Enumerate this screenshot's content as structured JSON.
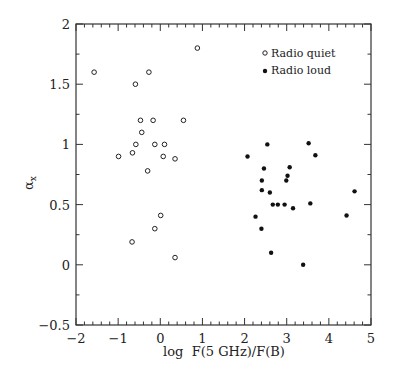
{
  "chart_data": {
    "type": "scatter",
    "title": "",
    "xlabel": "log F(5 GHz)/F(B)",
    "ylabel": "αx",
    "xlim": [
      -2,
      5
    ],
    "ylim": [
      -0.5,
      2
    ],
    "x_ticks": [
      -2,
      -1,
      0,
      1,
      2,
      3,
      4,
      5
    ],
    "x_tick_labels": [
      "−2",
      "−1",
      "0",
      "1",
      "2",
      "3",
      "4",
      "5"
    ],
    "y_ticks": [
      -0.5,
      0,
      0.5,
      1,
      1.5,
      2
    ],
    "y_tick_labels": [
      "−0.5",
      "0",
      "0.5",
      "1",
      "1.5",
      "2"
    ],
    "x_minor_step": 0.2,
    "y_minor_step": 0.25,
    "grid": false,
    "legend_position": "upper right",
    "series": [
      {
        "name": "Radio quiet",
        "marker": "open-circle",
        "points": [
          [
            -1.57,
            1.6
          ],
          [
            -0.59,
            1.5
          ],
          [
            -0.27,
            1.6
          ],
          [
            0.88,
            1.8
          ],
          [
            -0.47,
            1.2
          ],
          [
            -0.17,
            1.2
          ],
          [
            0.55,
            1.2
          ],
          [
            -0.44,
            1.1
          ],
          [
            -0.58,
            1.0
          ],
          [
            -0.13,
            1.0
          ],
          [
            0.1,
            1.0
          ],
          [
            -0.99,
            0.9
          ],
          [
            -0.66,
            0.93
          ],
          [
            0.07,
            0.9
          ],
          [
            0.35,
            0.88
          ],
          [
            -0.3,
            0.78
          ],
          [
            0.01,
            0.41
          ],
          [
            -0.13,
            0.3
          ],
          [
            -0.67,
            0.19
          ],
          [
            0.35,
            0.06
          ]
        ]
      },
      {
        "name": "Radio loud",
        "marker": "filled-circle",
        "points": [
          [
            2.54,
            1.0
          ],
          [
            3.52,
            1.01
          ],
          [
            2.07,
            0.9
          ],
          [
            3.68,
            0.91
          ],
          [
            2.46,
            0.8
          ],
          [
            3.07,
            0.81
          ],
          [
            3.02,
            0.74
          ],
          [
            2.99,
            0.7
          ],
          [
            2.41,
            0.7
          ],
          [
            2.41,
            0.62
          ],
          [
            2.6,
            0.6
          ],
          [
            4.61,
            0.61
          ],
          [
            2.67,
            0.5
          ],
          [
            2.79,
            0.5
          ],
          [
            2.95,
            0.5
          ],
          [
            3.15,
            0.47
          ],
          [
            3.56,
            0.51
          ],
          [
            2.26,
            0.4
          ],
          [
            4.42,
            0.41
          ],
          [
            2.4,
            0.3
          ],
          [
            2.63,
            0.1
          ],
          [
            3.39,
            0.0
          ]
        ]
      }
    ]
  },
  "legend": {
    "items": [
      {
        "label": "Radio quiet"
      },
      {
        "label": "Radio loud"
      }
    ]
  },
  "axes": {
    "xlabel": "log  F(5 GHz)/F(B)",
    "ylabel_main": "α",
    "ylabel_sub": "x"
  }
}
